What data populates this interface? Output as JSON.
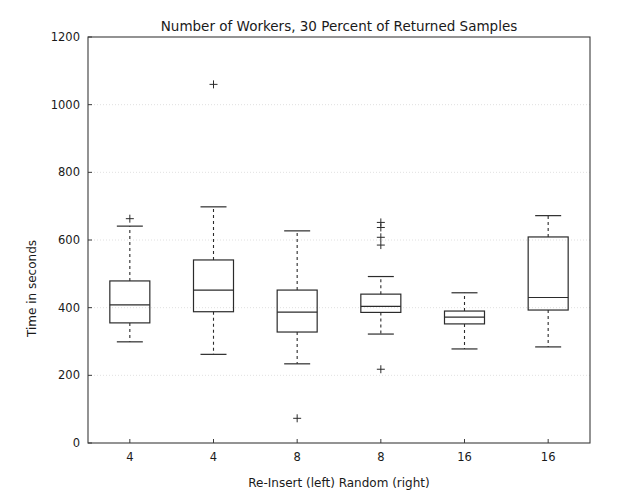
{
  "chart_data": {
    "type": "box",
    "title": "Number of Workers, 30 Percent of Returned Samples",
    "xlabel": "Re-Insert (left)   Random (right)",
    "ylabel": "Time in seconds",
    "ylim": [
      0,
      1200
    ],
    "yticks": [
      0,
      200,
      400,
      600,
      800,
      1000,
      1200
    ],
    "ytick_labels": [
      "0",
      "200",
      "400",
      "600",
      "800",
      "1000",
      "1200"
    ],
    "categories": [
      "4",
      "4",
      "8",
      "8",
      "16",
      "16"
    ],
    "grid": true,
    "legend": "none",
    "boxes": [
      {
        "label": "4",
        "group": "Re-Insert",
        "whisker_low": 299,
        "q1": 355,
        "median": 408,
        "q3": 479,
        "whisker_high": 641,
        "outliers": [
          663
        ]
      },
      {
        "label": "4",
        "group": "Random",
        "whisker_low": 262,
        "q1": 388,
        "median": 452,
        "q3": 541,
        "whisker_high": 698,
        "outliers": [
          1060
        ]
      },
      {
        "label": "8",
        "group": "Re-Insert",
        "whisker_low": 234,
        "q1": 328,
        "median": 387,
        "q3": 452,
        "whisker_high": 627,
        "outliers": [
          73
        ]
      },
      {
        "label": "8",
        "group": "Random",
        "whisker_low": 322,
        "q1": 386,
        "median": 404,
        "q3": 440,
        "whisker_high": 492,
        "outliers": [
          585,
          608,
          637,
          652,
          218
        ]
      },
      {
        "label": "16",
        "group": "Re-Insert",
        "whisker_low": 278,
        "q1": 352,
        "median": 372,
        "q3": 390,
        "whisker_high": 444,
        "outliers": []
      },
      {
        "label": "16",
        "group": "Random",
        "whisker_low": 284,
        "q1": 393,
        "median": 430,
        "q3": 609,
        "whisker_high": 672,
        "outliers": []
      }
    ]
  },
  "colors": {
    "background": "#ffffff",
    "line": "#2b2b2b",
    "spine": "#3b3b3b",
    "grid": "#d8d8d8",
    "text": "#1a1a1a"
  }
}
